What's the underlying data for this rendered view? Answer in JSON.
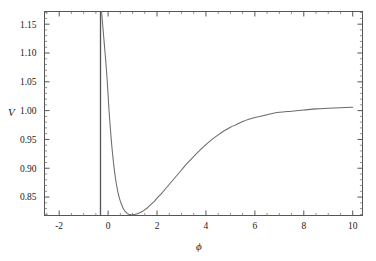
{
  "figure": {
    "background_color": "#ffffff",
    "frame_color": "#555555",
    "curve_color": "#6b6b6b",
    "text_color": "#1a1a1a"
  },
  "axes": {
    "x_title": "ϕ",
    "y_title": "V",
    "x_ticks": [
      "-2",
      "0",
      "2",
      "4",
      "6",
      "8",
      "10"
    ],
    "y_ticks": [
      "1.15",
      "1.10",
      "1.05",
      "1.00",
      "0.95",
      "0.90",
      "0.85"
    ]
  },
  "chart_data": {
    "type": "line",
    "title": "",
    "xlabel": "ϕ",
    "ylabel": "V",
    "xlim": [
      -2.6,
      10.4
    ],
    "ylim": [
      0.818,
      1.172
    ],
    "grid": false,
    "legend": null,
    "x_tick_values": [
      -2,
      0,
      2,
      4,
      6,
      8,
      10
    ],
    "y_tick_values": [
      1.15,
      1.1,
      1.05,
      1.0,
      0.95,
      0.9,
      0.85
    ],
    "x_minor_tick_step": 0.5,
    "y_minor_tick_step": 0.01,
    "annotations": [
      "vertical axis line drawn at phi = 0",
      "curve diverges upward as phi approaches 0 from the left",
      "minimum V approximately 0.820 at phi approximately 1.0",
      "curve approaches asymptote V approximately 1.006 as phi increases to 10"
    ],
    "series": [
      {
        "name": "V(ϕ)",
        "color": "#6b6b6b",
        "x": [
          -0.27,
          -0.26,
          -0.25,
          -0.24,
          -0.22,
          -0.2,
          -0.18,
          -0.16,
          -0.14,
          -0.12,
          -0.1,
          -0.08,
          -0.06,
          -0.04,
          -0.02,
          0.0,
          0.02,
          0.05,
          0.08,
          0.12,
          0.16,
          0.2,
          0.25,
          0.3,
          0.35,
          0.4,
          0.45,
          0.5,
          0.55,
          0.6,
          0.65,
          0.7,
          0.75,
          0.8,
          0.85,
          0.9,
          0.95,
          1.0,
          1.05,
          1.1,
          1.15,
          1.2,
          1.3,
          1.4,
          1.5,
          1.6,
          1.7,
          1.8,
          1.9,
          2.0,
          2.2,
          2.4,
          2.6,
          2.8,
          3.0,
          3.2,
          3.4,
          3.6,
          3.8,
          4.0,
          4.25,
          4.5,
          4.75,
          5.0,
          5.25,
          5.5,
          5.75,
          6.0,
          6.5,
          7.0,
          7.5,
          8.0,
          8.5,
          9.0,
          9.5,
          10.0
        ],
        "y": [
          1.172,
          1.168,
          1.163,
          1.158,
          1.148,
          1.138,
          1.128,
          1.118,
          1.108,
          1.098,
          1.088,
          1.077,
          1.066,
          1.054,
          1.041,
          1.027,
          1.012,
          0.993,
          0.976,
          0.954,
          0.935,
          0.918,
          0.899,
          0.883,
          0.87,
          0.859,
          0.85,
          0.843,
          0.837,
          0.832,
          0.828,
          0.825,
          0.823,
          0.821,
          0.82,
          0.8196,
          0.8194,
          0.8194,
          0.8196,
          0.82,
          0.8205,
          0.821,
          0.823,
          0.825,
          0.828,
          0.831,
          0.835,
          0.839,
          0.843,
          0.848,
          0.857,
          0.867,
          0.877,
          0.887,
          0.897,
          0.907,
          0.916,
          0.925,
          0.933,
          0.941,
          0.95,
          0.958,
          0.965,
          0.971,
          0.976,
          0.981,
          0.985,
          0.988,
          0.993,
          0.997,
          0.999,
          1.001,
          1.003,
          1.004,
          1.005,
          1.006
        ]
      }
    ]
  }
}
